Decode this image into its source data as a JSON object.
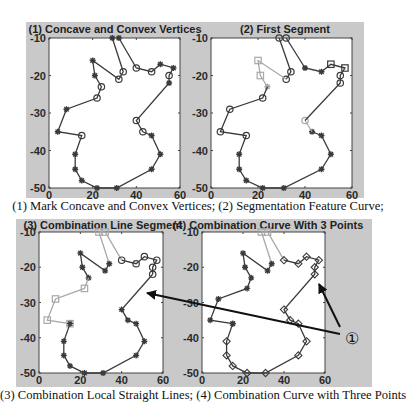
{
  "captions": {
    "top": "(1) Mark Concave and Convex Vertices; (2) Segmentation Feature Curve;",
    "bottom": "(3) Combination Local Straight Lines; (4) Combination Curve with Three Points"
  },
  "callout": {
    "label": "①"
  },
  "colors": {
    "panel": "#c9c9c9",
    "dark_line": "#3a3a3a",
    "light_line": "#a8a8a8",
    "plot_bg": "#ffffff"
  },
  "chart_data": [
    {
      "type": "line",
      "title": "(1) Concave and Convex Vertices",
      "xlim": [
        0,
        60
      ],
      "ylim": [
        -50,
        -10
      ],
      "xticks": [
        0,
        20,
        40,
        60
      ],
      "yticks": [
        -10,
        -20,
        -30,
        -40,
        -50
      ],
      "grid": false,
      "series": [
        {
          "name": "contour",
          "color": "dark",
          "points": [
            [
              29,
              -10
            ],
            [
              34,
              -19
            ],
            [
              32,
              -21
            ],
            [
              20,
              -16
            ],
            [
              21,
              -20
            ],
            [
              24,
              -23
            ],
            [
              22,
              -26
            ],
            [
              8,
              -29
            ],
            [
              4,
              -35
            ],
            [
              15,
              -36
            ],
            [
              12,
              -41
            ],
            [
              12,
              -45
            ],
            [
              15,
              -48
            ],
            [
              22,
              -50
            ],
            [
              31,
              -50
            ],
            [
              47,
              -45
            ],
            [
              51,
              -41
            ],
            [
              47,
              -36
            ],
            [
              43,
              -35
            ],
            [
              40,
              -32
            ],
            [
              55,
              -22
            ],
            [
              55,
              -20
            ],
            [
              57,
              -18
            ],
            [
              51,
              -17
            ],
            [
              47,
              -19
            ],
            [
              40,
              -18
            ],
            [
              32,
              -10
            ]
          ],
          "markers": [
            "star",
            "circle",
            "circle",
            "star",
            "star",
            "circle",
            "circle",
            "star",
            "star",
            "circle",
            "star",
            "star",
            "star",
            "star",
            "star",
            "star",
            "star",
            "star",
            "circle",
            "circle",
            "star",
            "circle",
            "star",
            "star",
            "circle",
            "circle",
            "star"
          ]
        }
      ]
    },
    {
      "type": "line",
      "title": "(2) First Segment",
      "xlim": [
        0,
        60
      ],
      "ylim": [
        -50,
        -10
      ],
      "xticks": [
        0,
        20,
        40,
        60
      ],
      "yticks": [
        -10,
        -20,
        -30,
        -40,
        -50
      ],
      "grid": false,
      "series": [
        {
          "name": "segment-a",
          "color": "dark",
          "points": [
            [
              29,
              -10
            ],
            [
              34,
              -19
            ],
            [
              32,
              -21
            ]
          ],
          "markers": [
            "circle",
            "circle",
            "circle"
          ]
        },
        {
          "name": "segment-b",
          "color": "light",
          "points": [
            [
              32,
              -21
            ],
            [
              20,
              -16
            ],
            [
              21,
              -20
            ],
            [
              24,
              -23
            ]
          ],
          "markers": [
            "none",
            "square",
            "square",
            "star"
          ]
        },
        {
          "name": "segment-c",
          "color": "dark",
          "points": [
            [
              24,
              -23
            ],
            [
              22,
              -26
            ],
            [
              8,
              -29
            ],
            [
              4,
              -35
            ],
            [
              15,
              -36
            ],
            [
              12,
              -41
            ],
            [
              12,
              -45
            ],
            [
              15,
              -48
            ],
            [
              22,
              -50
            ],
            [
              31,
              -50
            ],
            [
              47,
              -45
            ],
            [
              51,
              -41
            ],
            [
              47,
              -36
            ],
            [
              43,
              -35
            ]
          ],
          "markers": [
            "none",
            "circle",
            "circle",
            "circle",
            "circle",
            "star",
            "star",
            "star",
            "star",
            "star",
            "star",
            "star",
            "star",
            "star"
          ]
        },
        {
          "name": "segment-d",
          "color": "light",
          "points": [
            [
              43,
              -35
            ],
            [
              40,
              -32
            ]
          ],
          "markers": [
            "none",
            "circle"
          ]
        },
        {
          "name": "segment-e",
          "color": "dark",
          "points": [
            [
              40,
              -32
            ],
            [
              55,
              -22
            ],
            [
              55,
              -20
            ],
            [
              57,
              -18
            ],
            [
              51,
              -17
            ],
            [
              47,
              -19
            ]
          ],
          "markers": [
            "none",
            "circle",
            "circle",
            "square",
            "square",
            "star"
          ]
        },
        {
          "name": "segment-f",
          "color": "dark",
          "points": [
            [
              47,
              -19
            ],
            [
              40,
              -18
            ],
            [
              32,
              -10
            ]
          ],
          "markers": [
            "none",
            "star",
            "circle"
          ]
        }
      ]
    },
    {
      "type": "line",
      "title": "(3) Combination Line Segment",
      "xlim": [
        0,
        60
      ],
      "ylim": [
        -50,
        -10
      ],
      "xticks": [
        0,
        20,
        40,
        60
      ],
      "yticks": [
        -10,
        -20,
        -30,
        -40,
        -50
      ],
      "grid": false,
      "series": [
        {
          "name": "top-light",
          "color": "light",
          "points": [
            [
              40,
              -18
            ],
            [
              32,
              -10
            ],
            [
              29,
              -10
            ],
            [
              34,
              -19
            ]
          ],
          "markers": [
            "none",
            "square",
            "square",
            "none"
          ]
        },
        {
          "name": "upper-dark",
          "color": "dark",
          "points": [
            [
              34,
              -19
            ],
            [
              32,
              -21
            ],
            [
              20,
              -16
            ],
            [
              21,
              -20
            ],
            [
              24,
              -23
            ]
          ],
          "markers": [
            "star",
            "star",
            "star",
            "star",
            "star"
          ]
        },
        {
          "name": "left-light",
          "color": "light",
          "points": [
            [
              24,
              -23
            ],
            [
              22,
              -26
            ],
            [
              8,
              -29
            ],
            [
              4,
              -35
            ],
            [
              15,
              -36
            ]
          ],
          "markers": [
            "none",
            "square",
            "square",
            "square",
            "square"
          ]
        },
        {
          "name": "bottom-dark",
          "color": "dark",
          "points": [
            [
              15,
              -36
            ],
            [
              12,
              -41
            ],
            [
              12,
              -45
            ],
            [
              15,
              -48
            ],
            [
              22,
              -50
            ],
            [
              31,
              -50
            ],
            [
              47,
              -45
            ],
            [
              51,
              -41
            ],
            [
              47,
              -36
            ],
            [
              43,
              -35
            ],
            [
              40,
              -32
            ],
            [
              55,
              -22
            ]
          ],
          "markers": [
            "star",
            "star",
            "star",
            "star",
            "star",
            "star",
            "star",
            "star",
            "star",
            "star",
            "star",
            "circle"
          ]
        },
        {
          "name": "right-top",
          "color": "dark",
          "points": [
            [
              55,
              -22
            ],
            [
              55,
              -20
            ],
            [
              57,
              -18
            ],
            [
              51,
              -17
            ],
            [
              47,
              -19
            ],
            [
              40,
              -18
            ]
          ],
          "markers": [
            "none",
            "circle",
            "circle",
            "circle",
            "circle",
            "circle"
          ]
        }
      ]
    },
    {
      "type": "line",
      "title": "(4) Combination Curve With 3 Points",
      "xlim": [
        0,
        60
      ],
      "ylim": [
        -50,
        -10
      ],
      "xticks": [
        0,
        20,
        40,
        60
      ],
      "yticks": [
        -10,
        -20,
        -30,
        -40,
        -50
      ],
      "grid": false,
      "series": [
        {
          "name": "top-light",
          "color": "light",
          "points": [
            [
              40,
              -18
            ],
            [
              32,
              -10
            ],
            [
              29,
              -10
            ],
            [
              34,
              -19
            ]
          ],
          "markers": [
            "none",
            "square",
            "square",
            "none"
          ]
        },
        {
          "name": "upper-dark",
          "color": "dark",
          "points": [
            [
              34,
              -19
            ],
            [
              32,
              -21
            ],
            [
              20,
              -16
            ],
            [
              21,
              -20
            ],
            [
              24,
              -23
            ],
            [
              22,
              -26
            ],
            [
              8,
              -29
            ],
            [
              4,
              -35
            ],
            [
              15,
              -36
            ]
          ],
          "markers": [
            "star",
            "star",
            "star",
            "star",
            "star",
            "star",
            "star",
            "star",
            "star"
          ]
        },
        {
          "name": "bottom-curve",
          "color": "dark",
          "points": [
            [
              15,
              -36
            ],
            [
              12,
              -41
            ],
            [
              12,
              -45
            ],
            [
              15,
              -48
            ],
            [
              22,
              -50
            ],
            [
              31,
              -50
            ],
            [
              47,
              -45
            ],
            [
              51,
              -41
            ],
            [
              47,
              -36
            ],
            [
              43,
              -35
            ],
            [
              40,
              -32
            ],
            [
              55,
              -22
            ],
            [
              55,
              -20
            ],
            [
              57,
              -18
            ],
            [
              51,
              -17
            ],
            [
              47,
              -19
            ],
            [
              40,
              -18
            ]
          ],
          "markers": [
            "star",
            "diamond",
            "diamond",
            "diamond",
            "diamond",
            "diamond",
            "diamond",
            "diamond",
            "diamond",
            "diamond",
            "diamond",
            "diamond",
            "diamond",
            "diamond",
            "diamond",
            "diamond",
            "diamond"
          ]
        }
      ]
    }
  ]
}
